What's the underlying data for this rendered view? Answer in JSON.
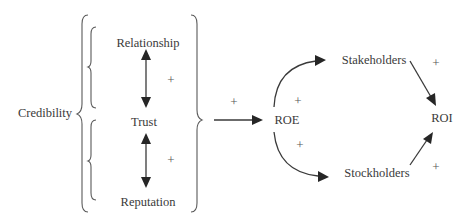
{
  "diagram": {
    "nodes": {
      "credibility": "Credibility",
      "relationship": "Relationship",
      "trust": "Trust",
      "reputation": "Reputation",
      "roe": "ROE",
      "stakeholders": "Stakeholders",
      "stockholders": "Stockholders",
      "roi": "ROI"
    },
    "polarities": {
      "relationship_trust": "+",
      "trust_reputation": "+",
      "credibility_roe": "+",
      "roe_stakeholders": "+",
      "roe_stockholders": "+",
      "stakeholders_roi": "+",
      "stockholders_roi": "+"
    },
    "edges": [
      {
        "from": "Relationship",
        "to": "Trust",
        "type": "bidirectional",
        "sign": "+"
      },
      {
        "from": "Trust",
        "to": "Reputation",
        "type": "bidirectional",
        "sign": "+"
      },
      {
        "from": "Credibility",
        "to": "ROE",
        "type": "directed",
        "sign": "+"
      },
      {
        "from": "ROE",
        "to": "Stakeholders",
        "type": "directed",
        "sign": "+"
      },
      {
        "from": "ROE",
        "to": "Stockholders",
        "type": "directed",
        "sign": "+"
      },
      {
        "from": "Stakeholders",
        "to": "ROI",
        "type": "directed",
        "sign": "+"
      },
      {
        "from": "Stockholders",
        "to": "ROI",
        "type": "directed",
        "sign": "+"
      }
    ],
    "groups": [
      {
        "label": "Credibility",
        "members": [
          "Relationship",
          "Trust",
          "Reputation"
        ]
      }
    ],
    "colors": {
      "text": "#3a3a3a",
      "line": "#3a3a3a",
      "background": "#ffffff"
    }
  }
}
